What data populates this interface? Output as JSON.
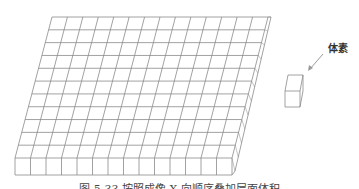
{
  "diagram": {
    "slab": {
      "columns": 14,
      "rows": 11,
      "layers": 1
    },
    "voxel_label": "体素",
    "caption": "图 5-33  按照成像 X 向顺序叠加层面体积",
    "colors": {
      "line": "#8a8a8a",
      "arrow": "#9a9a9a",
      "background": "#ffffff"
    }
  }
}
